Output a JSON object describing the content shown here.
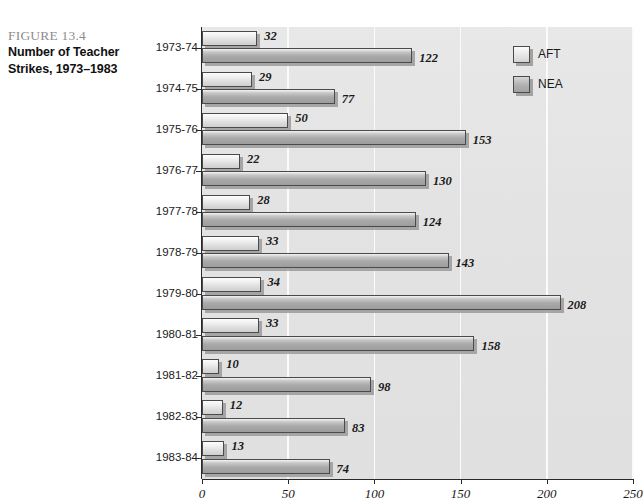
{
  "caption": {
    "figure_number": "FIGURE 13.4",
    "title_line1": "Number of Teacher",
    "title_line2": "Strikes, 1973–1983"
  },
  "legend": {
    "position": "top-right",
    "items": [
      {
        "label": "AFT",
        "swatch": "aft",
        "color": "#e4e4e4"
      },
      {
        "label": "NEA",
        "swatch": "nea",
        "color": "#b0b0b0"
      }
    ]
  },
  "axis": {
    "x_ticks": [
      "0",
      "50",
      "100",
      "150",
      "200",
      "250"
    ],
    "x_min": 0,
    "x_max": 250
  },
  "chart_data": {
    "type": "bar",
    "orientation": "horizontal",
    "title": "Number of Teacher Strikes, 1973–1983",
    "xlabel": "",
    "ylabel": "",
    "xlim": [
      0,
      250
    ],
    "grid": true,
    "legend_position": "top-right",
    "categories": [
      "1973-74",
      "1974-75",
      "1975-76",
      "1976-77",
      "1977-78",
      "1978-79",
      "1979-80",
      "1980-81",
      "1981-82",
      "1982-83",
      "1983-84"
    ],
    "series": [
      {
        "name": "AFT",
        "values": [
          32,
          29,
          50,
          22,
          28,
          33,
          34,
          33,
          10,
          12,
          13
        ]
      },
      {
        "name": "NEA",
        "values": [
          122,
          77,
          153,
          130,
          124,
          143,
          208,
          158,
          98,
          83,
          74
        ]
      }
    ]
  }
}
